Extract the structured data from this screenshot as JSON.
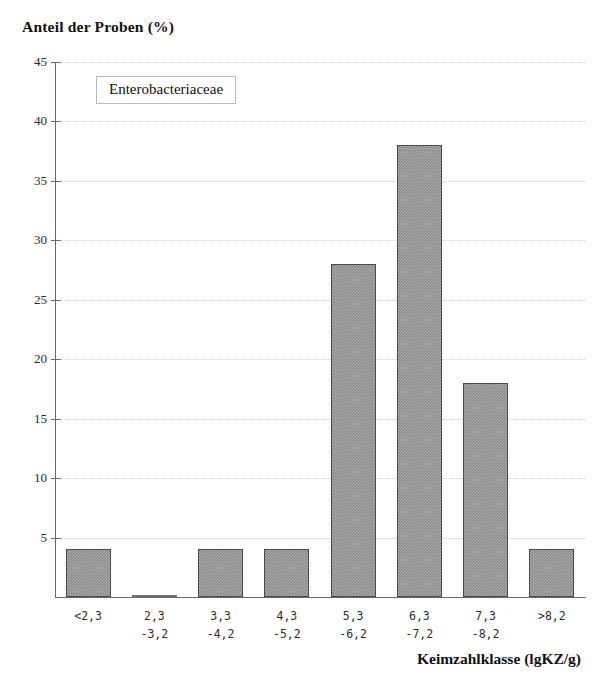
{
  "chart_data": {
    "type": "bar",
    "title": "",
    "ylabel": "Anteil der Proben (%)",
    "xlabel": "Keimzahlklasse (lgKZ/g)",
    "legend": "Enterobacteriaceae",
    "legend_position": "top-left-inside",
    "grid": true,
    "ylim": [
      0,
      45
    ],
    "yticks": [
      45,
      40,
      35,
      30,
      25,
      20,
      15,
      10,
      5
    ],
    "ytick_labels": [
      "45",
      "40",
      "35",
      "30",
      "25",
      "20",
      "15",
      "10",
      "5"
    ],
    "categories": [
      "<2,3",
      "2,3\n-3,2",
      "3,3\n-4,2",
      "4,3\n-5,2",
      "5,3\n-6,2",
      "6,3\n-7,2",
      "7,3\n-8,2",
      ">8,2"
    ],
    "category_lines": [
      {
        "line1": "<2,3",
        "line2": ""
      },
      {
        "line1": "2,3",
        "line2": "-3,2"
      },
      {
        "line1": "3,3",
        "line2": "-4,2"
      },
      {
        "line1": "4,3",
        "line2": "-5,2"
      },
      {
        "line1": "5,3",
        "line2": "-6,2"
      },
      {
        "line1": "6,3",
        "line2": "-7,2"
      },
      {
        "line1": "7,3",
        "line2": "-8,2"
      },
      {
        "line1": ">8,2",
        "line2": ""
      }
    ],
    "values": [
      4,
      0.2,
      4,
      4,
      28,
      38,
      18,
      4
    ],
    "bar_color": "#8a8a8a",
    "bar_edge_color": "#4a4a4a",
    "axis_color": "#6a6a6a",
    "grid_color": "#cfcfcf"
  }
}
